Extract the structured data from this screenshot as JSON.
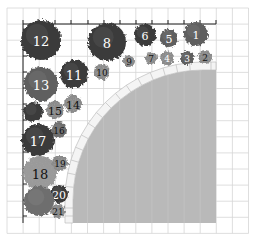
{
  "diagram": {
    "type": "garden-planting-plan",
    "grid": {
      "origin_x": 7,
      "origin_y": 8,
      "cell": 16.1,
      "cols": 15,
      "rows": 14,
      "line_color": "#d6d6d6"
    },
    "axis": {
      "x_from": 23,
      "x_to": 216,
      "y": 24,
      "y_from": 24,
      "y_to": 223,
      "ticks_x": [
        23,
        39,
        55,
        71,
        88,
        104,
        120,
        136,
        152,
        168,
        184,
        200,
        216
      ],
      "ticks_y": [
        40,
        56,
        72,
        88,
        104,
        120,
        136,
        152,
        168,
        184,
        200,
        216
      ],
      "color": "#222"
    },
    "lawn": {
      "color": "#b9b9b9",
      "x": 73,
      "y": 70,
      "right": 216,
      "bottom": 223,
      "corner_radius": 130
    },
    "colors": {
      "dark": "#3a3a3a",
      "mid": "#5e5e5e",
      "medium_gray": "#6e6e6e",
      "light": "#9a9a9a",
      "speckle": "#8a8a8a",
      "paver": "#f4f4f4",
      "paver_line": "#bdbdbd"
    }
  },
  "plants": [
    {
      "id": "1",
      "label": "1",
      "cx": 196,
      "cy": 34,
      "r": 12,
      "tone": "mid",
      "text": "light"
    },
    {
      "id": "2",
      "label": "2",
      "cx": 205,
      "cy": 57,
      "r": 7,
      "tone": "speckle",
      "text": "dark"
    },
    {
      "id": "3",
      "label": "3",
      "cx": 187,
      "cy": 58,
      "r": 7,
      "tone": "mid",
      "text": "light"
    },
    {
      "id": "4",
      "label": "4",
      "cx": 167,
      "cy": 58,
      "r": 7,
      "tone": "speckle",
      "text": "light"
    },
    {
      "id": "5",
      "label": "5",
      "cx": 169,
      "cy": 38,
      "r": 9,
      "tone": "mid",
      "text": "light"
    },
    {
      "id": "6",
      "label": "6",
      "cx": 145,
      "cy": 35,
      "r": 11,
      "tone": "dark",
      "text": "light"
    },
    {
      "id": "7",
      "label": "7",
      "cx": 151,
      "cy": 58,
      "r": 6,
      "tone": "speckle",
      "text": "dark"
    },
    {
      "id": "8",
      "label": "8",
      "cx": 107,
      "cy": 42,
      "r": 19,
      "tone": "dark",
      "text": "light"
    },
    {
      "id": "9",
      "label": "9",
      "cx": 129,
      "cy": 61,
      "r": 6,
      "tone": "speckle",
      "text": "dark"
    },
    {
      "id": "10",
      "label": "10",
      "cx": 102,
      "cy": 72,
      "r": 8,
      "tone": "speckle",
      "text": "dark"
    },
    {
      "id": "11",
      "label": "11",
      "cx": 74,
      "cy": 74,
      "r": 14,
      "tone": "dark",
      "text": "light"
    },
    {
      "id": "12",
      "label": "12",
      "cx": 41,
      "cy": 40,
      "r": 20,
      "tone": "dark",
      "text": "light"
    },
    {
      "id": "13",
      "label": "13",
      "cx": 41,
      "cy": 84,
      "r": 17,
      "tone": "mid",
      "text": "light"
    },
    {
      "id": "14",
      "label": "14",
      "cx": 73,
      "cy": 104,
      "r": 9,
      "tone": "speckle",
      "text": "dark"
    },
    {
      "id": "15",
      "label": "15",
      "cx": 55,
      "cy": 110,
      "r": 9,
      "tone": "speckle",
      "text": "dark"
    },
    {
      "id": "16",
      "label": "16",
      "cx": 59,
      "cy": 130,
      "r": 8,
      "tone": "medium_gray",
      "text": "dark"
    },
    {
      "id": "17",
      "label": "17",
      "cx": 38,
      "cy": 140,
      "r": 16,
      "tone": "dark",
      "text": "light"
    },
    {
      "id": "18",
      "label": "18",
      "cx": 40,
      "cy": 173,
      "r": 17,
      "tone": "light",
      "text": "dark"
    },
    {
      "id": "19",
      "label": "19",
      "cx": 60,
      "cy": 163,
      "r": 8,
      "tone": "speckle",
      "text": "dark"
    },
    {
      "id": "20",
      "label": "20",
      "cx": 59,
      "cy": 194,
      "r": 9,
      "tone": "dark",
      "text": "light"
    },
    {
      "id": "21",
      "label": "21",
      "cx": 58,
      "cy": 211,
      "r": 7,
      "tone": "speckle",
      "text": "dark"
    },
    {
      "id": "unlabeled-a",
      "label": "",
      "cx": 33,
      "cy": 112,
      "r": 10,
      "tone": "dark",
      "text": "light"
    },
    {
      "id": "unlabeled-b",
      "label": "",
      "cx": 39,
      "cy": 201,
      "r": 15,
      "tone": "medium_gray",
      "text": "light"
    }
  ]
}
